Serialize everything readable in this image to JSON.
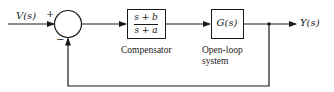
{
  "diagram": {
    "type": "feedback-control-block-diagram",
    "input": {
      "label": "V(s)"
    },
    "summing_junction": {
      "plus_sign": "+",
      "minus_sign": "−"
    },
    "compensator": {
      "numerator": "s + b",
      "denominator": "s + a",
      "caption": "Compensator"
    },
    "plant": {
      "transfer_function": "G(s)",
      "caption_line1": "Open-loop",
      "caption_line2": "system"
    },
    "output": {
      "label": "Y(s)"
    },
    "feedback": {
      "type": "unity",
      "sign": "negative"
    },
    "colors": {
      "stroke": "#1a1a1a",
      "background": "#ffffff"
    }
  }
}
